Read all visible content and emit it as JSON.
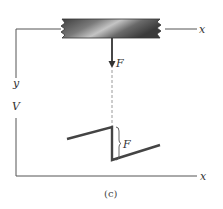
{
  "figure": {
    "caption": "(c)",
    "colors": {
      "line": "#555555",
      "beam_dark": "#3a3a3a",
      "beam_light": "#b8b8b8",
      "dashed": "#9a9a9a",
      "text": "#333333"
    }
  },
  "free_body": {
    "x_label": "x",
    "y_label": "y",
    "force_label": "F"
  },
  "shear_diagram": {
    "v_axis_label": "V",
    "x_axis_label": "x",
    "jump_label": "F"
  }
}
